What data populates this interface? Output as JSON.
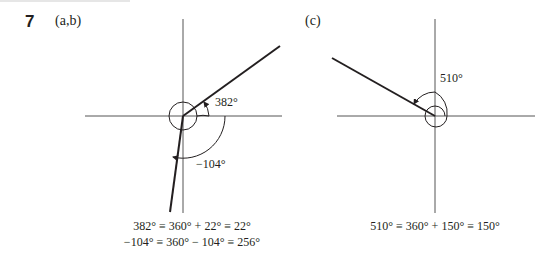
{
  "question": {
    "number": "7",
    "parts": [
      {
        "id": "ab",
        "label": "(a,b)",
        "angles": [
          {
            "name": "382-angle",
            "label": "382°",
            "degrees": 382
          },
          {
            "name": "neg-104-angle",
            "label": "−104°",
            "degrees": -104
          }
        ],
        "equations": [
          "382° ≡ 360° + 22° ≡ 22°",
          "−104° ≡ 360° − 104° ≡ 256°"
        ]
      },
      {
        "id": "c",
        "label": "(c)",
        "angles": [
          {
            "name": "510-angle",
            "label": "510°",
            "degrees": 510
          }
        ],
        "equations": [
          "510° ≡ 360° + 150° ≡ 150°"
        ]
      }
    ]
  },
  "colors": {
    "ink": "#231f20",
    "axis": "#555555"
  }
}
